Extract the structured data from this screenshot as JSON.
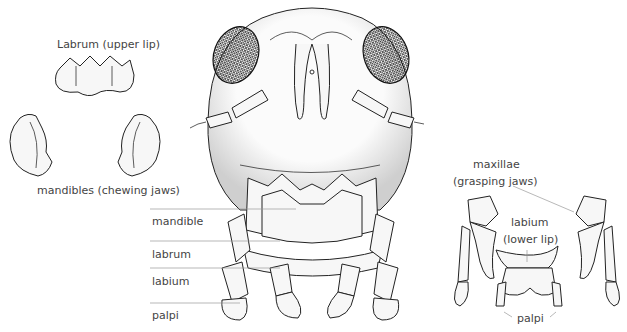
{
  "figure": {
    "labels": {
      "labrum_detail": "Labrum (upper lip)",
      "mandibles_detail": "mandibles (chewing jaws)",
      "maxillae_line1": "maxillae",
      "maxillae_line2": "(grasping jaws)",
      "labium_line1": "labium",
      "labium_line2": "(lower lip)",
      "palpi_detail": "palpi"
    },
    "head_callouts": [
      {
        "label": "mandible"
      },
      {
        "label": "labrum"
      },
      {
        "label": "labium"
      },
      {
        "label": "palpi"
      }
    ]
  }
}
